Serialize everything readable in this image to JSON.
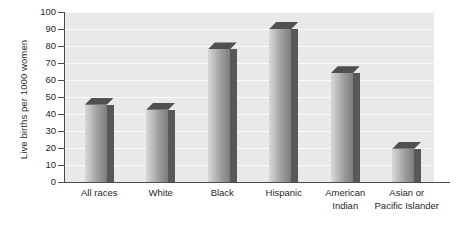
{
  "chart_data": {
    "type": "bar",
    "title": "",
    "subtitle": "",
    "xlabel": "",
    "ylabel": "Live births per 1000 women",
    "categories": [
      "All races",
      "White",
      "Black",
      "Hispanic",
      "American Indian",
      "Asian or Pacific Islander"
    ],
    "category_lines": [
      [
        "All races"
      ],
      [
        "White"
      ],
      [
        "Black"
      ],
      [
        "Hispanic"
      ],
      [
        "American",
        "Indian"
      ],
      [
        "Asian or",
        "Pacific Islander"
      ]
    ],
    "values": [
      45.5,
      42.5,
      78,
      90,
      64,
      19.5
    ],
    "ylim": [
      0,
      100
    ],
    "ytick_labels": [
      "0",
      "10",
      "20",
      "30",
      "40",
      "50",
      "60",
      "70",
      "80",
      "90",
      "100"
    ],
    "ytick_values": [
      0,
      10,
      20,
      30,
      40,
      50,
      60,
      70,
      80,
      90,
      100
    ],
    "grid": true,
    "grid_axis": "y",
    "legend": false,
    "legend_position": "none",
    "style": "3d-bar",
    "colors": {
      "plot_background": "#e9e9e9",
      "gridline": "#fbfbfb",
      "axis": "#4a4a4a",
      "bar_face_light": "#d8d8d8",
      "bar_face_dark": "#7e7e7e",
      "bar_side": "#585858",
      "bar_top": "#4f4f4f",
      "text": "#1f1f1f",
      "page_background": "#ffffff"
    }
  }
}
